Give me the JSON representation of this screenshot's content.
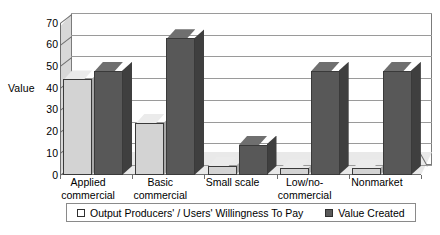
{
  "chart_data": {
    "type": "bar",
    "title": "",
    "subtitle": "",
    "xlabel": "",
    "ylabel": "Value",
    "ylim": [
      0,
      70
    ],
    "ytick_step": 10,
    "yticks": [
      70,
      60,
      50,
      40,
      30,
      20,
      10,
      0
    ],
    "grid": true,
    "three_d": true,
    "legend_position": "bottom",
    "categories": [
      "Applied\ncommercial",
      "Basic\ncommercial",
      "Small scale",
      "Low/no-\ncommercial",
      "Nonmarket"
    ],
    "series": [
      {
        "name": "Output Producers' / Users' Willingness To Pay",
        "color": "#d3d3d3",
        "values": [
          44,
          24,
          4,
          3,
          3
        ]
      },
      {
        "name": "Value Created",
        "color": "#585858",
        "values": [
          48,
          63,
          14,
          48,
          48
        ]
      }
    ]
  },
  "axis": {
    "y_label": "Value",
    "y_ticks": [
      "70",
      "60",
      "50",
      "40",
      "30",
      "20",
      "10",
      "0"
    ]
  },
  "legend": {
    "entries": [
      {
        "label": "Output Producers' / Users' Willingness To Pay",
        "swatch": "legend-swatch-light"
      },
      {
        "label": "Value Created",
        "swatch": "legend-swatch-dark"
      }
    ]
  },
  "colors": {
    "series_a_face": "#d3d3d3",
    "series_b_face": "#585858",
    "gridline": "#9a9a9a",
    "axis": "#6e6e6e",
    "background": "#ffffff"
  }
}
